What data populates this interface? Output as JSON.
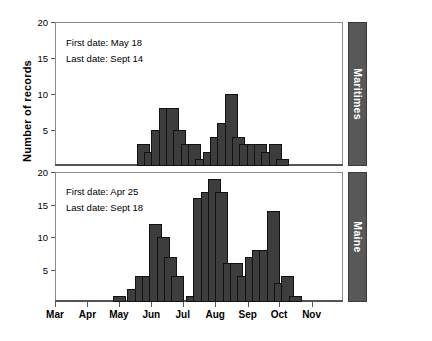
{
  "chart_data": {
    "type": "bar",
    "title": "",
    "xlabel": "",
    "ylabel": "Number of records",
    "ylim": [
      0,
      20
    ],
    "yticks": [
      0,
      5,
      10,
      15,
      20
    ],
    "grid": false,
    "legend_position": "right-strip",
    "x_axis": {
      "type": "month",
      "tick_labels": [
        "Mar",
        "Apr",
        "May",
        "Jun",
        "Jul",
        "Aug",
        "Sep",
        "Oct",
        "Nov"
      ],
      "range": [
        "Mar 1",
        "Nov 30"
      ],
      "bin": "weekly"
    },
    "panels": [
      {
        "name": "Maritimes",
        "strip_label": "Maritimes",
        "annotations": [
          "First date: May 18",
          "Last date: Sept 14"
        ],
        "first_date": "May 18",
        "last_date": "Sept 14",
        "ylim": [
          0,
          20
        ],
        "bars": [
          {
            "week_start": "May 18",
            "value": 3
          },
          {
            "week_start": "May 25",
            "value": 2
          },
          {
            "week_start": "Jun 1",
            "value": 5
          },
          {
            "week_start": "Jun 8",
            "value": 8
          },
          {
            "week_start": "Jun 15",
            "value": 8
          },
          {
            "week_start": "Jun 22",
            "value": 5
          },
          {
            "week_start": "Jun 29",
            "value": 3
          },
          {
            "week_start": "Jul 6",
            "value": 3
          },
          {
            "week_start": "Jul 13",
            "value": 1
          },
          {
            "week_start": "Jul 20",
            "value": 2
          },
          {
            "week_start": "Jul 27",
            "value": 4
          },
          {
            "week_start": "Aug 3",
            "value": 6
          },
          {
            "week_start": "Aug 10",
            "value": 10
          },
          {
            "week_start": "Aug 17",
            "value": 4
          },
          {
            "week_start": "Aug 24",
            "value": 3
          },
          {
            "week_start": "Aug 31",
            "value": 3
          },
          {
            "week_start": "Sep 7",
            "value": 3
          },
          {
            "week_start": "Sep 14",
            "value": 2
          },
          {
            "week_start": "Sep 21",
            "value": 3
          },
          {
            "week_start": "Sep 28",
            "value": 1
          }
        ]
      },
      {
        "name": "Maine",
        "strip_label": "Maine",
        "annotations": [
          "First date: Apr 25",
          "Last date: Sept 18"
        ],
        "first_date": "Apr 25",
        "last_date": "Sept 18",
        "ylim": [
          0,
          20
        ],
        "bars": [
          {
            "week_start": "Apr 25",
            "value": 1
          },
          {
            "week_start": "May 9",
            "value": 2
          },
          {
            "week_start": "May 16",
            "value": 4
          },
          {
            "week_start": "May 23",
            "value": 4
          },
          {
            "week_start": "May 30",
            "value": 12
          },
          {
            "week_start": "Jun 6",
            "value": 10
          },
          {
            "week_start": "Jun 13",
            "value": 7
          },
          {
            "week_start": "Jun 20",
            "value": 4
          },
          {
            "week_start": "Jul 4",
            "value": 1
          },
          {
            "week_start": "Jul 11",
            "value": 16
          },
          {
            "week_start": "Jul 18",
            "value": 17
          },
          {
            "week_start": "Jul 25",
            "value": 19
          },
          {
            "week_start": "Aug 1",
            "value": 17
          },
          {
            "week_start": "Aug 8",
            "value": 6
          },
          {
            "week_start": "Aug 15",
            "value": 6
          },
          {
            "week_start": "Aug 22",
            "value": 4
          },
          {
            "week_start": "Aug 29",
            "value": 7
          },
          {
            "week_start": "Sep 5",
            "value": 8
          },
          {
            "week_start": "Sep 12",
            "value": 8
          },
          {
            "week_start": "Sep 19",
            "value": 14
          },
          {
            "week_start": "Sep 26",
            "value": 3
          },
          {
            "week_start": "Oct 3",
            "value": 4
          },
          {
            "week_start": "Oct 10",
            "value": 1
          }
        ]
      }
    ]
  }
}
